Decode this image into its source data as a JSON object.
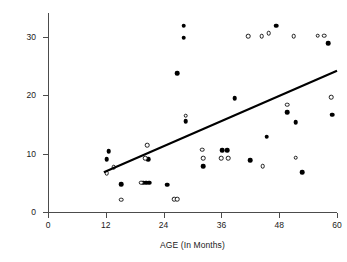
{
  "chart_data": {
    "type": "scatter",
    "title": "",
    "xlabel": "AGE (In Months)",
    "ylabel": "Distance (In Meters)",
    "xlim": [
      0,
      60
    ],
    "ylim": [
      0,
      32
    ],
    "xticks": [
      0,
      12,
      24,
      36,
      48,
      60
    ],
    "yticks": [
      0,
      10,
      20,
      30
    ],
    "xticklabels": [
      "0",
      "12",
      "24",
      "36",
      "48",
      "60"
    ],
    "yticklabels": [
      "0",
      "10",
      "20",
      "30"
    ],
    "grid": false,
    "legend": null,
    "series": [
      {
        "name": "filled-circles",
        "marker": "filled circle",
        "color": "#000000",
        "points": [
          {
            "x": 12.6,
            "y": 10.4
          },
          {
            "x": 12.2,
            "y": 9.0
          },
          {
            "x": 15.2,
            "y": 4.8
          },
          {
            "x": 19.8,
            "y": 5.0
          },
          {
            "x": 20.4,
            "y": 5.0
          },
          {
            "x": 21.0,
            "y": 5.0
          },
          {
            "x": 20.8,
            "y": 9.1
          },
          {
            "x": 24.8,
            "y": 4.7
          },
          {
            "x": 28.2,
            "y": 31.9
          },
          {
            "x": 28.2,
            "y": 29.9
          },
          {
            "x": 26.8,
            "y": 23.8
          },
          {
            "x": 28.6,
            "y": 15.6
          },
          {
            "x": 32.2,
            "y": 7.9
          },
          {
            "x": 36.2,
            "y": 10.6
          },
          {
            "x": 37.2,
            "y": 10.6
          },
          {
            "x": 38.8,
            "y": 19.5
          },
          {
            "x": 42.0,
            "y": 8.9
          },
          {
            "x": 45.4,
            "y": 12.9
          },
          {
            "x": 47.4,
            "y": 31.9
          },
          {
            "x": 49.6,
            "y": 17.1
          },
          {
            "x": 51.4,
            "y": 15.4
          },
          {
            "x": 52.8,
            "y": 6.8
          },
          {
            "x": 58.2,
            "y": 28.9
          },
          {
            "x": 59.0,
            "y": 16.7
          }
        ]
      },
      {
        "name": "open-circles",
        "marker": "open circle",
        "color": "#1a1a1a",
        "points": [
          {
            "x": 12.2,
            "y": 6.7
          },
          {
            "x": 13.6,
            "y": 7.7
          },
          {
            "x": 15.2,
            "y": 2.1
          },
          {
            "x": 19.4,
            "y": 5.0
          },
          {
            "x": 20.2,
            "y": 9.2
          },
          {
            "x": 20.6,
            "y": 11.4
          },
          {
            "x": 26.2,
            "y": 2.2
          },
          {
            "x": 26.8,
            "y": 2.2
          },
          {
            "x": 28.6,
            "y": 16.5
          },
          {
            "x": 32.0,
            "y": 10.7
          },
          {
            "x": 32.2,
            "y": 9.2
          },
          {
            "x": 36.0,
            "y": 9.2
          },
          {
            "x": 37.4,
            "y": 9.2
          },
          {
            "x": 41.6,
            "y": 30.1
          },
          {
            "x": 44.4,
            "y": 30.1
          },
          {
            "x": 45.8,
            "y": 30.6
          },
          {
            "x": 44.6,
            "y": 7.9
          },
          {
            "x": 49.6,
            "y": 18.4
          },
          {
            "x": 51.0,
            "y": 30.1
          },
          {
            "x": 51.4,
            "y": 9.3
          },
          {
            "x": 56.0,
            "y": 30.2
          },
          {
            "x": 57.4,
            "y": 30.2
          },
          {
            "x": 58.8,
            "y": 19.7
          }
        ]
      }
    ],
    "fit_line": {
      "name": "regression-line",
      "color": "#000000",
      "x0": 11.6,
      "y0": 6.8,
      "x1": 60.0,
      "y1": 24.2
    }
  }
}
